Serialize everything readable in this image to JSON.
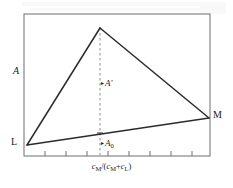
{
  "figure": {
    "type": "diagram",
    "axes": {
      "y_label": "A",
      "x_label_parts": {
        "num_var": "c",
        "num_sub": "M",
        "slash": "/(",
        "den_var1": "c",
        "den_sub1": "M",
        "plus": "+",
        "den_var2": "c",
        "den_sub2": "L",
        "close": ")"
      },
      "x_label_plain": "cM/(cM+cL)",
      "frame": {
        "left": 24,
        "top": 14,
        "right": 210,
        "bottom": 156
      },
      "x_ticks": [
        24,
        45,
        66,
        87,
        100,
        108,
        129,
        150,
        171,
        192,
        210
      ],
      "y_ticks": [],
      "grid": false
    },
    "vertices": {
      "L": {
        "label": "L",
        "x": 27,
        "y": 145
      },
      "M": {
        "label": "M",
        "x": 209,
        "y": 118
      },
      "apex": {
        "label": "",
        "x": 100,
        "y": 28
      }
    },
    "annotations": [
      {
        "name": "A-prime",
        "text": "A",
        "prime": "′",
        "marker": "▸",
        "x": 100,
        "y": 85
      },
      {
        "name": "A-zero",
        "text": "A",
        "sub": "0",
        "marker": "▸",
        "x": 100,
        "y": 145
      }
    ],
    "dashed_line": {
      "x": 100,
      "y_top": 28,
      "y_bottom": 156,
      "intersect_y": 133
    },
    "colors": {
      "stroke": "#2b2b2b",
      "frame": "#6f6f6f",
      "dashed": "#9a9a9a",
      "background": "#ffffff",
      "text": "#1a1a1a"
    }
  }
}
